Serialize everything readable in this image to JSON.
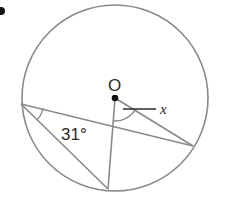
{
  "problem": {
    "marker": "b"
  },
  "diagram": {
    "center_label": "O",
    "inscribed_angle_label": "31°",
    "unknown_label": "x",
    "colors": {
      "stroke": "#8a8a8a",
      "text": "#2a2a2a"
    }
  }
}
